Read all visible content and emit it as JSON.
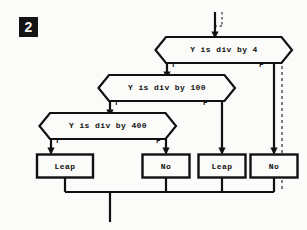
{
  "figure": {
    "badge": "2",
    "background_color": "#fbfbfa",
    "ink_color": "#111111"
  },
  "decisions": [
    {
      "id": "div-by-4",
      "text": "Y is div by 4",
      "true_label": "T",
      "false_label": "F",
      "cx": 224,
      "cy": 50,
      "w": 137,
      "h": 26
    },
    {
      "id": "div-by-100",
      "text": "Y is div by 100",
      "true_label": "T",
      "false_label": "F",
      "cx": 167,
      "cy": 88,
      "w": 137,
      "h": 26
    },
    {
      "id": "div-by-400",
      "text": "Y is div by 400",
      "true_label": "T",
      "false_label": "F",
      "cx": 108,
      "cy": 126,
      "w": 137,
      "h": 26
    }
  ],
  "terminals": [
    {
      "id": "leap-1",
      "text": "Leap",
      "cx": 65,
      "cy": 166,
      "w": 56,
      "h": 23
    },
    {
      "id": "no-1",
      "text": "No",
      "cx": 166,
      "cy": 166,
      "w": 47,
      "h": 23
    },
    {
      "id": "leap-2",
      "text": "Leap",
      "cx": 222,
      "cy": 166,
      "w": 47,
      "h": 23
    },
    {
      "id": "no-2",
      "text": "No",
      "cx": 274,
      "cy": 166,
      "w": 47,
      "h": 23
    }
  ],
  "branch_labels": [
    {
      "text": "T",
      "x": 171,
      "y": 62
    },
    {
      "text": "F",
      "x": 259,
      "y": 62
    },
    {
      "text": "T",
      "x": 114,
      "y": 100
    },
    {
      "text": "F",
      "x": 203,
      "y": 100
    },
    {
      "text": "T",
      "x": 58,
      "y": 138
    },
    {
      "text": "F",
      "x": 156,
      "y": 138
    }
  ],
  "annotations": {
    "entry_arrow": "entry flows into first decision",
    "exit_line": "all four terminal outcomes merge into one exit",
    "dashed_guides": "dashed alignment guides at entry and on far-right branch"
  }
}
